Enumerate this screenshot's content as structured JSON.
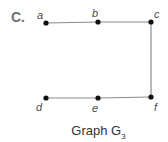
{
  "part_label": "C.",
  "caption": {
    "prefix": "Graph ",
    "main": "G",
    "subscript": "3"
  },
  "graph": {
    "vertices": [
      {
        "id": "a",
        "label": "a",
        "x": 46,
        "y": 23,
        "lx": 37,
        "ly": 19
      },
      {
        "id": "b",
        "label": "b",
        "x": 98,
        "y": 22,
        "lx": 92,
        "ly": 17
      },
      {
        "id": "c",
        "label": "c",
        "x": 151,
        "y": 22,
        "lx": 154,
        "ly": 18
      },
      {
        "id": "d",
        "label": "d",
        "x": 46,
        "y": 98,
        "lx": 36,
        "ly": 111
      },
      {
        "id": "e",
        "label": "e",
        "x": 98,
        "y": 98,
        "lx": 92,
        "ly": 112
      },
      {
        "id": "f",
        "label": "f",
        "x": 151,
        "y": 97,
        "lx": 154,
        "ly": 111
      }
    ],
    "edges": [
      [
        "a",
        "b"
      ],
      [
        "b",
        "c"
      ],
      [
        "c",
        "f"
      ],
      [
        "f",
        "e"
      ],
      [
        "e",
        "d"
      ]
    ],
    "colors": {
      "edge": "#8a8a8a",
      "vertex": "#111111"
    }
  }
}
